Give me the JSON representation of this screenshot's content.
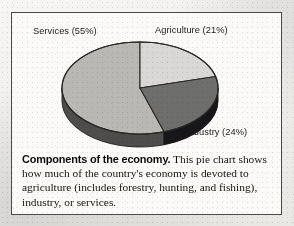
{
  "figure": {
    "background_color": "#f2f1ef",
    "frame_color": "#4b4a48",
    "panel_color": "#fbfaf8"
  },
  "caption": {
    "title": "Components of the economy.",
    "body": " This pie chart shows how much of the country's economy is devoted to agriculture (includes forestry, hunting, and fishing), industry, or services."
  },
  "labels": {
    "services": "Services (55%)",
    "agriculture": "Agriculture (21%)",
    "industry": "Industry (24%)"
  },
  "chart_data": {
    "type": "pie",
    "title": "Components of the economy",
    "xlabel": "",
    "ylabel": "",
    "three_d": true,
    "start_angle_deg": 0,
    "direction": "clockwise",
    "center": [
      140,
      88
    ],
    "radius_x": 78,
    "radius_y": 46,
    "depth_px": 13,
    "legend": "none (direct slice labels)",
    "grid": false,
    "categories": [
      "Agriculture",
      "Industry",
      "Services"
    ],
    "values": [
      21,
      24,
      55
    ],
    "units": "percent",
    "slices": [
      {
        "name": "Agriculture",
        "value": 21,
        "label": "Agriculture (21%)",
        "top_color": "#d9d8d6",
        "side_color": "#9c9b99",
        "start_deg": 0,
        "end_deg": 75.6
      },
      {
        "name": "Industry",
        "value": 24,
        "label": "Industry (24%)",
        "top_color": "#6e6e6d",
        "side_color": "#17171a",
        "start_deg": 75.6,
        "end_deg": 162.0
      },
      {
        "name": "Services",
        "value": 55,
        "label": "Services (55%)",
        "top_color": "#b9b8b5",
        "side_color": "#4e4d4c",
        "start_deg": 162.0,
        "end_deg": 360.0
      }
    ],
    "outline_color": "#2a2927"
  }
}
